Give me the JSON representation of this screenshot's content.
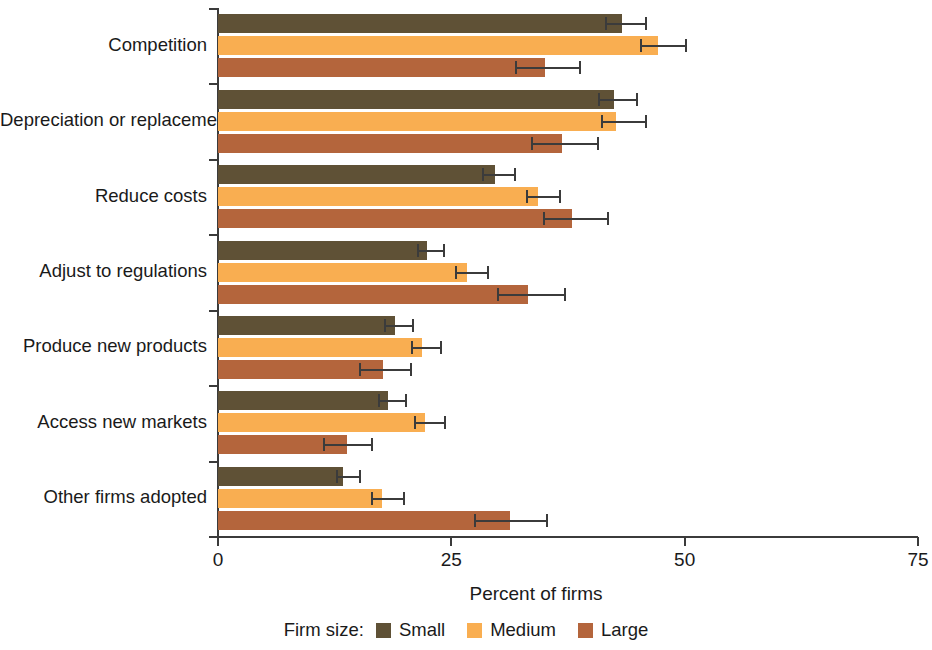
{
  "chart_data": {
    "type": "bar",
    "orientation": "horizontal",
    "title": "",
    "xlabel": "Percent of firms",
    "ylabel": "",
    "xlim": [
      0,
      75
    ],
    "xticks": [
      0,
      25,
      50,
      75
    ],
    "xtick_labels": [
      "0",
      "25",
      "50",
      "75"
    ],
    "grid": false,
    "legend_position": "bottom",
    "legend_title": "Firm size:",
    "categories": [
      "Competition",
      "Depreciation or replacement",
      "Reduce costs",
      "Adjust to regulations",
      "Produce new products",
      "Access new markets",
      "Other firms adopted"
    ],
    "series": [
      {
        "name": "Small",
        "color": "#5f5136",
        "values": [
          43.3,
          42.4,
          29.7,
          22.4,
          19.0,
          18.2,
          13.4
        ],
        "ci_low": [
          41.5,
          40.7,
          28.3,
          21.3,
          17.8,
          17.1,
          12.6
        ],
        "ci_high": [
          46.0,
          45.0,
          31.9,
          24.3,
          21.0,
          20.2,
          15.3
        ]
      },
      {
        "name": "Medium",
        "color": "#f9ae51",
        "values": [
          47.1,
          42.6,
          34.3,
          26.7,
          21.9,
          22.2,
          17.6
        ],
        "ci_low": [
          45.2,
          41.0,
          33.0,
          25.4,
          20.7,
          21.0,
          16.4
        ],
        "ci_high": [
          50.2,
          46.0,
          36.8,
          29.0,
          24.0,
          24.4,
          20.0
        ]
      },
      {
        "name": "Large",
        "color": "#b4653c",
        "values": [
          35.0,
          36.9,
          37.9,
          33.2,
          17.7,
          13.8,
          31.3
        ],
        "ci_low": [
          31.8,
          33.5,
          34.8,
          29.9,
          15.1,
          11.3,
          27.4
        ],
        "ci_high": [
          38.9,
          40.8,
          41.9,
          37.3,
          20.8,
          16.6,
          35.4
        ]
      }
    ]
  },
  "axis": {
    "x_title": "Percent of firms"
  },
  "legend": {
    "title": "Firm size:",
    "items": [
      {
        "label": "Small",
        "color": "#5f5136"
      },
      {
        "label": "Medium",
        "color": "#f9ae51"
      },
      {
        "label": "Large",
        "color": "#b4653c"
      }
    ]
  }
}
